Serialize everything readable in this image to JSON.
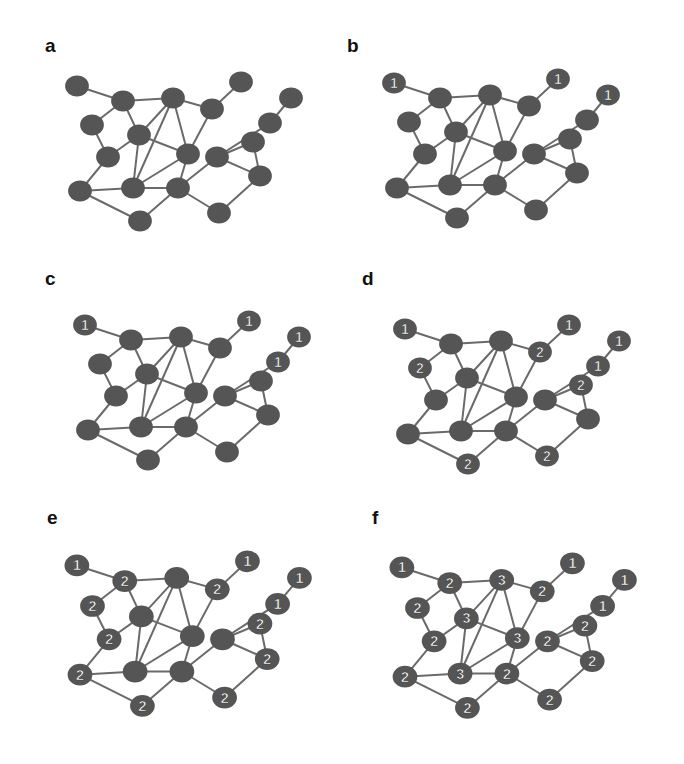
{
  "figure": {
    "background": "#ffffff",
    "node_color": "#555555",
    "edge_color": "#6a6a6a",
    "label_color": "#ffffff",
    "node_radius": 11,
    "nodes": [
      {
        "id": 0,
        "x": 77,
        "y": 86
      },
      {
        "id": 1,
        "x": 123,
        "y": 101
      },
      {
        "id": 2,
        "x": 173,
        "y": 98
      },
      {
        "id": 3,
        "x": 212,
        "y": 109
      },
      {
        "id": 4,
        "x": 241,
        "y": 82
      },
      {
        "id": 5,
        "x": 291,
        "y": 98
      },
      {
        "id": 6,
        "x": 92,
        "y": 125
      },
      {
        "id": 7,
        "x": 139,
        "y": 135
      },
      {
        "id": 8,
        "x": 270,
        "y": 123
      },
      {
        "id": 9,
        "x": 253,
        "y": 142
      },
      {
        "id": 10,
        "x": 108,
        "y": 157
      },
      {
        "id": 11,
        "x": 188,
        "y": 154
      },
      {
        "id": 12,
        "x": 217,
        "y": 157
      },
      {
        "id": 13,
        "x": 260,
        "y": 176
      },
      {
        "id": 14,
        "x": 80,
        "y": 191
      },
      {
        "id": 15,
        "x": 133,
        "y": 188
      },
      {
        "id": 16,
        "x": 178,
        "y": 188
      },
      {
        "id": 17,
        "x": 219,
        "y": 213
      },
      {
        "id": 18,
        "x": 140,
        "y": 221
      }
    ],
    "edges": [
      [
        0,
        1
      ],
      [
        1,
        2
      ],
      [
        1,
        6
      ],
      [
        1,
        7
      ],
      [
        2,
        3
      ],
      [
        2,
        7
      ],
      [
        2,
        15
      ],
      [
        2,
        11
      ],
      [
        3,
        4
      ],
      [
        3,
        11
      ],
      [
        5,
        8
      ],
      [
        8,
        12
      ],
      [
        6,
        10
      ],
      [
        7,
        10
      ],
      [
        7,
        11
      ],
      [
        7,
        15
      ],
      [
        9,
        12
      ],
      [
        9,
        13
      ],
      [
        12,
        13
      ],
      [
        10,
        14
      ],
      [
        11,
        15
      ],
      [
        11,
        16
      ],
      [
        12,
        16
      ],
      [
        14,
        15
      ],
      [
        14,
        18
      ],
      [
        15,
        16
      ],
      [
        16,
        18
      ],
      [
        16,
        17
      ],
      [
        17,
        13
      ]
    ],
    "panels": [
      {
        "label": "a",
        "label_x": 45,
        "label_y": 35,
        "dx": 0,
        "dy": 0,
        "scale": 1.0,
        "node_labels": {}
      },
      {
        "label": "b",
        "label_x": 347,
        "label_y": 35,
        "dx": 317,
        "dy": -3,
        "scale": 1.0,
        "node_labels": {
          "0": "1",
          "4": "1",
          "5": "1"
        }
      },
      {
        "label": "c",
        "label_x": 45,
        "label_y": 268,
        "dx": 8,
        "dy": 239,
        "scale": 1.0,
        "node_labels": {
          "0": "1",
          "4": "1",
          "5": "1",
          "8": "1"
        }
      },
      {
        "label": "d",
        "label_x": 362,
        "label_y": 268,
        "dx": 328,
        "dy": 243,
        "scale": 1.0,
        "node_labels": {
          "0": "1",
          "4": "1",
          "5": "1",
          "8": "1",
          "3": "2",
          "6": "2",
          "9": "2",
          "17": "2",
          "18": "2"
        }
      },
      {
        "label": "e",
        "label_x": 47,
        "label_y": 507,
        "dx": 4,
        "dy": 482,
        "scale": 1.04,
        "node_labels": {
          "0": "1",
          "4": "1",
          "5": "1",
          "8": "1",
          "1": "2",
          "3": "2",
          "6": "2",
          "9": "2",
          "10": "2",
          "13": "2",
          "14": "2",
          "17": "2",
          "18": "2"
        }
      },
      {
        "label": "f",
        "label_x": 372,
        "label_y": 507,
        "dx": 329,
        "dy": 484,
        "scale": 1.04,
        "node_labels": {
          "0": "1",
          "4": "1",
          "5": "1",
          "8": "1",
          "1": "2",
          "3": "2",
          "6": "2",
          "9": "2",
          "10": "2",
          "12": "2",
          "13": "2",
          "14": "2",
          "16": "2",
          "17": "2",
          "18": "2",
          "2": "3",
          "7": "3",
          "11": "3",
          "15": "3"
        }
      }
    ]
  }
}
